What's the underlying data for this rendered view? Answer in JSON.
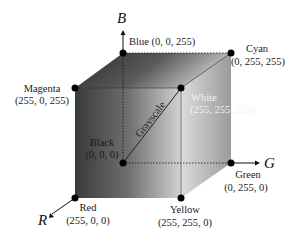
{
  "diagram": {
    "axes": [
      {
        "name": "B",
        "label": "B"
      },
      {
        "name": "G",
        "label": "G"
      },
      {
        "name": "R",
        "label": "R"
      }
    ],
    "vertices": [
      {
        "name": "Blue",
        "label": "Blue (0, 0, 255)"
      },
      {
        "name": "Cyan",
        "label": "Cyan",
        "coords": "(0, 255, 255)"
      },
      {
        "name": "Magenta",
        "label": "Magenta",
        "coords": "(255, 0, 255)"
      },
      {
        "name": "White",
        "label": "White",
        "coords": "(255, 255, 255)"
      },
      {
        "name": "Black",
        "label": "Black",
        "coords": "(0, 0, 0)"
      },
      {
        "name": "Green",
        "label": "Green",
        "coords": "(0, 255, 0)"
      },
      {
        "name": "Red",
        "label": "Red",
        "coords": "(255, 0, 0)"
      },
      {
        "name": "Yellow",
        "label": "Yellow",
        "coords": "(255, 255, 0)"
      }
    ],
    "diagonal_label": "Grayscale"
  }
}
